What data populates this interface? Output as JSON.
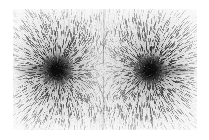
{
  "figure": {
    "kind": "photograph",
    "orientation": "landscape"
  },
  "canvas": {
    "width": 209,
    "height": 140,
    "background_color": "#ffffff"
  },
  "plate": {
    "x": 13,
    "y": 9,
    "width": 184,
    "height": 121,
    "base_color": "#ebebeb",
    "border_color": "#ffffff"
  },
  "poles": [
    {
      "label": "left-pole",
      "cx": 44,
      "cy": 61,
      "core_radius": 5.0,
      "halo_radius": 9.5,
      "core_color": "#0d0d0d",
      "field_lines": 230,
      "line_reach": 105
    },
    {
      "label": "right-pole",
      "cx": 137,
      "cy": 61,
      "core_radius": 5.0,
      "halo_radius": 9.5,
      "core_color": "#0d0d0d",
      "field_lines": 230,
      "line_reach": 105
    }
  ],
  "axis_streaks": [
    {
      "label": "left-outward-streak",
      "x1": 0,
      "x2": 38,
      "y": 61,
      "darkness": 0.42
    },
    {
      "label": "right-outward-streak",
      "x1": 143,
      "x2": 184,
      "y": 61,
      "darkness": 0.42
    }
  ],
  "neutral_zone": {
    "label": "neutral-region",
    "cx": 90,
    "cy": 61,
    "radius_x": 17,
    "radius_y": 40,
    "lightness": 0.34
  },
  "field_render": {
    "filing_count": 5200,
    "filing_min_length": 1.6,
    "filing_max_length": 5.2,
    "filing_color_dark": "#1a1a1a",
    "filing_color_light": "#9a9a9a",
    "grain_density": 0.42
  },
  "palette": {
    "paper": "#ffffff",
    "plate_light": "#f2f2f2",
    "plate_mid": "#c8c8c8",
    "plate_dark": "#4a4a4a",
    "pole_core": "#0d0d0d"
  }
}
